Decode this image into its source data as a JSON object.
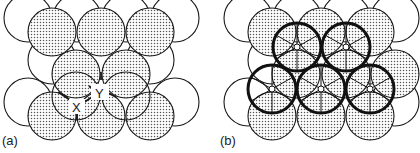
{
  "figure": {
    "panels": [
      {
        "id": "a",
        "label": "(a)",
        "points": [
          {
            "name": "X",
            "label": "X"
          },
          {
            "name": "Y",
            "label": "Y"
          }
        ]
      },
      {
        "id": "b",
        "label": "(b)"
      }
    ],
    "colors": {
      "stroke": "#1a1a1a",
      "shade_dot": "#555555",
      "background": "#ffffff"
    }
  }
}
